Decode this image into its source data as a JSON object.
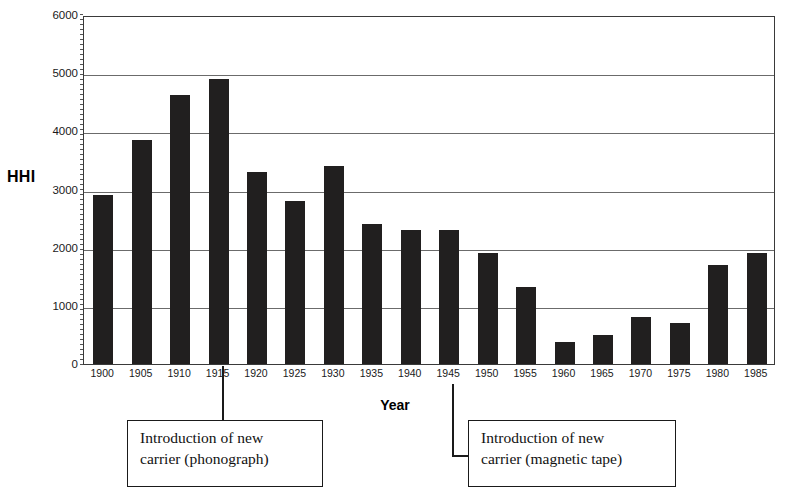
{
  "chart_data": {
    "type": "bar",
    "title": "",
    "xlabel": "Year",
    "ylabel": "HHI",
    "ylim": [
      0,
      6000
    ],
    "ytick_step": 1000,
    "yticks": [
      "6000",
      "5000",
      "4000",
      "3000",
      "2000",
      "1000",
      "0"
    ],
    "grid": true,
    "legend": false,
    "bar_color": "#211f1f",
    "categories": [
      "1900",
      "1905",
      "1910",
      "1915",
      "1920",
      "1925",
      "1930",
      "1935",
      "1940",
      "1945",
      "1950",
      "1955",
      "1960",
      "1965",
      "1970",
      "1975",
      "1980",
      "1985"
    ],
    "values": [
      2900,
      3850,
      4620,
      4900,
      3300,
      2800,
      3400,
      2400,
      2300,
      2300,
      1900,
      1320,
      380,
      500,
      800,
      700,
      1700,
      1900
    ],
    "annotations": [
      {
        "id": "phonograph",
        "lines": [
          "Introduction of new",
          "carrier (phonograph)"
        ],
        "points_to_category": "1915"
      },
      {
        "id": "magnetic-tape",
        "lines": [
          "Introduction of new",
          "carrier (magnetic tape)"
        ],
        "points_to_category": "1945"
      }
    ]
  },
  "axis": {
    "y_title": "HHI",
    "x_title": "Year"
  }
}
